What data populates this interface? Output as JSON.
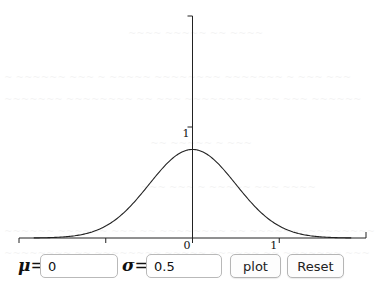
{
  "plot": {
    "title": "Normal distribution PDF",
    "x_axis": {
      "min": -2,
      "max": 2,
      "ticks": [
        -2,
        -1,
        0,
        1,
        2
      ],
      "tick_labels": [
        "",
        "",
        "0",
        "1",
        ""
      ]
    },
    "y_axis": {
      "min": 0,
      "max": 2,
      "ticks": [
        1,
        2
      ],
      "tick_labels": [
        "1",
        ""
      ]
    },
    "curve": {
      "type": "normal-pdf",
      "mu": 0,
      "sigma": 0.5,
      "x_from": -1.83,
      "x_to": 1.83
    },
    "line_color": "#222222"
  },
  "chart_data": {
    "type": "line",
    "title": "",
    "xlabel": "",
    "ylabel": "",
    "xlim": [
      -2,
      2
    ],
    "ylim": [
      0,
      2
    ],
    "x_tick_labels": [
      "0",
      "1"
    ],
    "y_tick_labels": [
      "1"
    ],
    "series": [
      {
        "name": "N(0, 0.5) pdf",
        "function": "normal_pdf",
        "mu": 0,
        "sigma": 0.5,
        "peak": 0.798
      }
    ],
    "grid": false
  },
  "controls": {
    "mu_label": "μ",
    "sigma_label": "σ",
    "equals": "=",
    "mu_value": "0",
    "sigma_value": "0.5",
    "plot_button": "plot",
    "reset_button": "Reset"
  }
}
